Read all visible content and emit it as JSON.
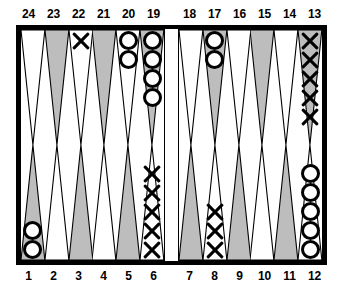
{
  "figure": {
    "kind": "backgammon-board"
  },
  "colors": {
    "frame": "#000000",
    "board_background": "#ffffff",
    "point_shaded": "#bdbdbd",
    "point_light": "#ffffff",
    "outline": "#000000",
    "label": "#000000"
  },
  "labels": {
    "top_left": [
      "24",
      "23",
      "22",
      "21",
      "20",
      "19"
    ],
    "top_right": [
      "18",
      "17",
      "16",
      "15",
      "14",
      "13"
    ],
    "bottom_left": [
      "1",
      "2",
      "3",
      "4",
      "5",
      "6"
    ],
    "bottom_right": [
      "7",
      "8",
      "9",
      "10",
      "11",
      "12"
    ]
  },
  "board": {
    "top_left": [
      {
        "point": "24",
        "shade": "light",
        "checker": "none",
        "count": 0
      },
      {
        "point": "23",
        "shade": "shaded",
        "checker": "none",
        "count": 0
      },
      {
        "point": "22",
        "shade": "light",
        "checker": "X",
        "count": 1
      },
      {
        "point": "21",
        "shade": "shaded",
        "checker": "none",
        "count": 0
      },
      {
        "point": "20",
        "shade": "light",
        "checker": "O",
        "count": 2
      },
      {
        "point": "19",
        "shade": "shaded",
        "checker": "O",
        "count": 4
      }
    ],
    "top_right": [
      {
        "point": "18",
        "shade": "light",
        "checker": "none",
        "count": 0
      },
      {
        "point": "17",
        "shade": "shaded",
        "checker": "O",
        "count": 2
      },
      {
        "point": "16",
        "shade": "light",
        "checker": "none",
        "count": 0
      },
      {
        "point": "15",
        "shade": "shaded",
        "checker": "none",
        "count": 0
      },
      {
        "point": "14",
        "shade": "light",
        "checker": "none",
        "count": 0
      },
      {
        "point": "13",
        "shade": "shaded",
        "checker": "X",
        "count": 5
      }
    ],
    "bottom_left": [
      {
        "point": "1",
        "shade": "shaded",
        "checker": "O",
        "count": 2
      },
      {
        "point": "2",
        "shade": "light",
        "checker": "none",
        "count": 0
      },
      {
        "point": "3",
        "shade": "shaded",
        "checker": "none",
        "count": 0
      },
      {
        "point": "4",
        "shade": "light",
        "checker": "none",
        "count": 0
      },
      {
        "point": "5",
        "shade": "shaded",
        "checker": "none",
        "count": 0
      },
      {
        "point": "6",
        "shade": "light",
        "checker": "X",
        "count": 5
      }
    ],
    "bottom_right": [
      {
        "point": "7",
        "shade": "shaded",
        "checker": "none",
        "count": 0
      },
      {
        "point": "8",
        "shade": "light",
        "checker": "X",
        "count": 3
      },
      {
        "point": "9",
        "shade": "shaded",
        "checker": "none",
        "count": 0
      },
      {
        "point": "10",
        "shade": "light",
        "checker": "none",
        "count": 0
      },
      {
        "point": "11",
        "shade": "shaded",
        "checker": "none",
        "count": 0
      },
      {
        "point": "12",
        "shade": "light",
        "checker": "O",
        "count": 5
      }
    ]
  }
}
